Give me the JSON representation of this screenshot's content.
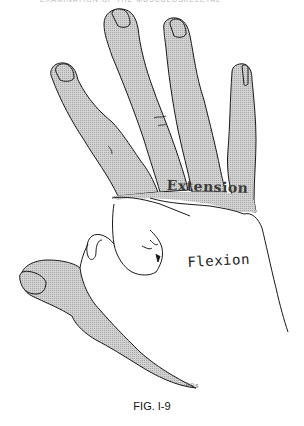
{
  "page": {
    "header_text": "EXAMINATION OF THE MUSCULOSKELETAL SYSTEM"
  },
  "figure": {
    "labels": {
      "extension": "Extension",
      "flexion": "Flexion"
    },
    "artist_initials": "DRS",
    "caption": "FIG. I-9",
    "colors": {
      "shaded_fill": "#c9c9c9",
      "outline": "#1a1a1a",
      "background": "#ffffff"
    }
  }
}
